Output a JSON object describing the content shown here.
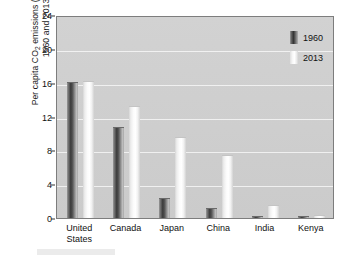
{
  "chart_data": {
    "type": "bar",
    "title": "",
    "subtitle": "",
    "xlabel": "",
    "ylabel": "Per capita CO2 emissions (metric tons), 1960 and 2013",
    "ylabel_line1": "Per capita CO",
    "ylabel_sub": "2",
    "ylabel_line1_rest": " emissions (metric tons),",
    "ylabel_line2": "1960 and 2013",
    "categories": [
      "United States",
      "Canada",
      "Japan",
      "China",
      "India",
      "Kenya"
    ],
    "category_labels": [
      "United\nStates",
      "Canada",
      "Japan",
      "China",
      "India",
      "Kenya"
    ],
    "series": [
      {
        "name": "1960",
        "values": [
          16.1,
          10.8,
          2.4,
          1.2,
          0.27,
          0.2
        ],
        "color": "#3a3a3a"
      },
      {
        "name": "2013",
        "values": [
          16.2,
          13.3,
          9.6,
          7.4,
          1.5,
          0.3
        ],
        "color": "#f2f2f2"
      }
    ],
    "ylim": [
      0,
      24
    ],
    "yticks": [
      0,
      4,
      8,
      12,
      16,
      20,
      24
    ],
    "ytick_labels": [
      "0",
      "4",
      "8",
      "12",
      "16",
      "20",
      "24"
    ],
    "grid": true,
    "grid_color": "#f3f3f3",
    "legend_position": "top-right",
    "plot_background": "#cfcfcf",
    "figure_background": "#ffffff"
  },
  "legend": {
    "entries": [
      {
        "label": "1960",
        "swatch": "dark-gradient-bar"
      },
      {
        "label": "2013",
        "swatch": "light-gradient-bar"
      }
    ]
  }
}
